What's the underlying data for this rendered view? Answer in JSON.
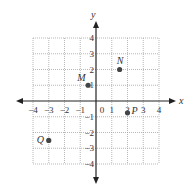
{
  "chart_data": {
    "type": "scatter",
    "title": "",
    "xlabel": "x",
    "ylabel": "y",
    "xlim": [
      -4,
      4
    ],
    "ylim": [
      -4,
      4
    ],
    "grid": true,
    "x_ticks": [
      "-4",
      "-3",
      "-2",
      "-1",
      "0",
      "1",
      "2",
      "3",
      "4"
    ],
    "y_ticks": [
      "4",
      "3",
      "2",
      "1",
      "-1",
      "-2",
      "-3",
      "-4"
    ],
    "points": [
      {
        "label": "M",
        "x": -0.5,
        "y": 1
      },
      {
        "label": "N",
        "x": 1.5,
        "y": 2
      },
      {
        "label": "P",
        "x": 2,
        "y": -0.75
      },
      {
        "label": "Q",
        "x": -3,
        "y": -2.5
      }
    ],
    "colors": {
      "axis": "#222222",
      "grid": "#999999",
      "point": "#444444"
    }
  }
}
